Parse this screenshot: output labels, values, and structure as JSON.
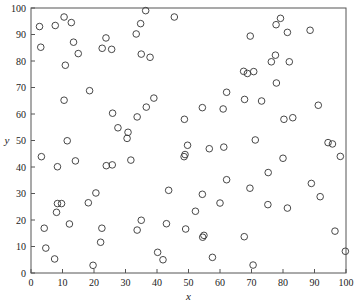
{
  "chart_data": {
    "type": "scatter",
    "title": "",
    "xlabel": "x",
    "ylabel": "y",
    "xlim": [
      0,
      100
    ],
    "ylim": [
      0,
      100
    ],
    "xticks": [
      0,
      10,
      20,
      30,
      40,
      50,
      60,
      70,
      80,
      90,
      100
    ],
    "yticks": [
      0,
      10,
      20,
      30,
      40,
      50,
      60,
      70,
      80,
      90,
      100
    ],
    "grid": false,
    "legend": null,
    "marker": "open-circle",
    "marker_color": "#333333",
    "points": [
      [
        2.7,
        93.0
      ],
      [
        3.1,
        85.2
      ],
      [
        7.7,
        93.4
      ],
      [
        10.5,
        96.6
      ],
      [
        12.8,
        94.5
      ],
      [
        13.5,
        87.1
      ],
      [
        15.0,
        82.8
      ],
      [
        10.9,
        78.4
      ],
      [
        18.6,
        68.8
      ],
      [
        23.8,
        88.7
      ],
      [
        22.6,
        84.8
      ],
      [
        25.6,
        84.4
      ],
      [
        36.4,
        99.0
      ],
      [
        45.5,
        96.6
      ],
      [
        34.8,
        94.1
      ],
      [
        33.4,
        90.2
      ],
      [
        35.0,
        82.6
      ],
      [
        37.8,
        81.4
      ],
      [
        79.2,
        96.1
      ],
      [
        77.8,
        93.7
      ],
      [
        81.4,
        90.8
      ],
      [
        88.6,
        91.6
      ],
      [
        69.6,
        89.4
      ],
      [
        77.6,
        82.2
      ],
      [
        76.3,
        79.7
      ],
      [
        82.0,
        79.7
      ],
      [
        67.5,
        76.1
      ],
      [
        68.7,
        75.3
      ],
      [
        70.7,
        76.0
      ],
      [
        77.9,
        71.7
      ],
      [
        62.1,
        68.2
      ],
      [
        10.5,
        65.2
      ],
      [
        25.9,
        60.3
      ],
      [
        27.6,
        54.8
      ],
      [
        30.8,
        53.1
      ],
      [
        30.5,
        50.8
      ],
      [
        11.5,
        49.9
      ],
      [
        3.3,
        43.9
      ],
      [
        8.4,
        40.1
      ],
      [
        14.1,
        42.3
      ],
      [
        23.9,
        40.5
      ],
      [
        25.8,
        40.8
      ],
      [
        31.7,
        42.6
      ],
      [
        39.0,
        66.0
      ],
      [
        36.6,
        62.6
      ],
      [
        33.7,
        58.9
      ],
      [
        48.7,
        58.0
      ],
      [
        54.4,
        62.4
      ],
      [
        61.0,
        61.9
      ],
      [
        49.7,
        48.2
      ],
      [
        56.6,
        46.9
      ],
      [
        61.2,
        47.5
      ],
      [
        48.9,
        44.7
      ],
      [
        48.6,
        43.9
      ],
      [
        67.8,
        65.5
      ],
      [
        73.2,
        64.9
      ],
      [
        91.2,
        63.3
      ],
      [
        80.3,
        58.0
      ],
      [
        83.1,
        58.6
      ],
      [
        71.2,
        50.2
      ],
      [
        94.3,
        49.2
      ],
      [
        95.7,
        48.7
      ],
      [
        98.2,
        44.0
      ],
      [
        80.0,
        43.3
      ],
      [
        75.3,
        37.9
      ],
      [
        89.0,
        33.8
      ],
      [
        20.6,
        30.2
      ],
      [
        18.2,
        26.5
      ],
      [
        8.4,
        26.2
      ],
      [
        9.7,
        26.2
      ],
      [
        8.1,
        22.9
      ],
      [
        12.2,
        18.5
      ],
      [
        4.2,
        16.9
      ],
      [
        22.5,
        16.9
      ],
      [
        22.1,
        11.6
      ],
      [
        4.7,
        9.4
      ],
      [
        7.5,
        5.3
      ],
      [
        19.7,
        2.9
      ],
      [
        62.1,
        35.2
      ],
      [
        43.7,
        31.2
      ],
      [
        54.4,
        29.7
      ],
      [
        60.0,
        26.4
      ],
      [
        52.2,
        23.3
      ],
      [
        35.0,
        19.9
      ],
      [
        33.7,
        16.2
      ],
      [
        43.0,
        18.6
      ],
      [
        49.1,
        16.6
      ],
      [
        54.9,
        14.2
      ],
      [
        54.5,
        13.5
      ],
      [
        40.2,
        7.8
      ],
      [
        41.9,
        5.0
      ],
      [
        57.6,
        5.9
      ],
      [
        69.5,
        32.0
      ],
      [
        91.8,
        28.8
      ],
      [
        75.2,
        25.8
      ],
      [
        81.4,
        24.5
      ],
      [
        96.5,
        15.8
      ],
      [
        67.7,
        13.7
      ],
      [
        99.8,
        8.2
      ],
      [
        70.5,
        3.0
      ]
    ]
  }
}
